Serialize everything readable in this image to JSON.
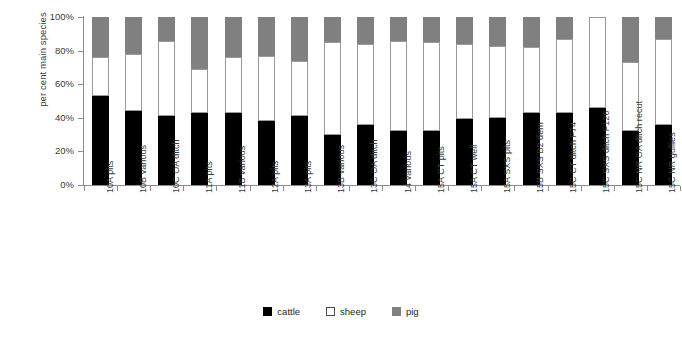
{
  "chart_data": {
    "type": "bar",
    "subtype": "stacked-100",
    "title": "",
    "xlabel": "",
    "ylabel": "per cent main species",
    "ylim": [
      0,
      100
    ],
    "ytick_labels": [
      "0%",
      "20%",
      "40%",
      "60%",
      "80%",
      "100%"
    ],
    "ytick_values": [
      0,
      20,
      40,
      60,
      80,
      100
    ],
    "grid": false,
    "legend_position": "bottom-center",
    "categories": [
      "10A pits",
      "10B various",
      "10C OA ditch",
      "11A pits",
      "11B various",
      "12A pits",
      "13A pits",
      "13B various",
      "13C OA ditch",
      "14 various",
      "15A CT pits",
      "15A CT well",
      "15A SXS pits",
      "15B SXS B2 dem",
      "15C CT ditch F74",
      "15C SXS ditch F126",
      "15C NR OA ditch recut",
      "15C NR gullies"
    ],
    "series": [
      {
        "name": "cattle",
        "color": "#000000",
        "values": [
          53,
          44,
          41,
          43,
          43,
          38,
          41,
          30,
          36,
          32,
          32,
          39,
          40,
          43,
          43,
          46,
          32,
          36
        ]
      },
      {
        "name": "sheep",
        "color": "#ffffff",
        "values": [
          23,
          34,
          45,
          26,
          33,
          39,
          33,
          55,
          48,
          54,
          53,
          45,
          43,
          39,
          44,
          54,
          41,
          51
        ]
      },
      {
        "name": "pig",
        "color": "#808080",
        "values": [
          24,
          22,
          14,
          31,
          24,
          23,
          26,
          15,
          16,
          14,
          15,
          16,
          17,
          18,
          13,
          0,
          27,
          13
        ]
      }
    ]
  },
  "legend": {
    "items": [
      {
        "label": "cattle",
        "swatch": "cattle-swatch"
      },
      {
        "label": "sheep",
        "swatch": "sheep-swatch"
      },
      {
        "label": "pig",
        "swatch": "pig-swatch"
      }
    ]
  }
}
